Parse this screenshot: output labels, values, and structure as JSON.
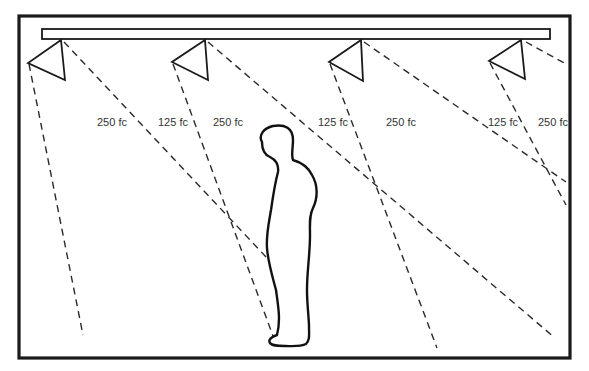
{
  "diagram": {
    "fixture_count": 4,
    "labels": [
      {
        "id": "l1",
        "text": "250 fc",
        "x": 97,
        "y": 117
      },
      {
        "id": "l2",
        "text": "125 fc",
        "x": 158,
        "y": 117
      },
      {
        "id": "l3",
        "text": "250 fc",
        "x": 213,
        "y": 117
      },
      {
        "id": "l4",
        "text": "125 fc",
        "x": 318,
        "y": 117
      },
      {
        "id": "l5",
        "text": "250 fc",
        "x": 386,
        "y": 117
      },
      {
        "id": "l6",
        "text": "125 fc",
        "x": 488,
        "y": 117
      },
      {
        "id": "l7",
        "text": "250 fc",
        "x": 538,
        "y": 117
      }
    ],
    "colors": {
      "line": "#1a1a1a",
      "text": "#333333",
      "background": "#ffffff"
    }
  }
}
